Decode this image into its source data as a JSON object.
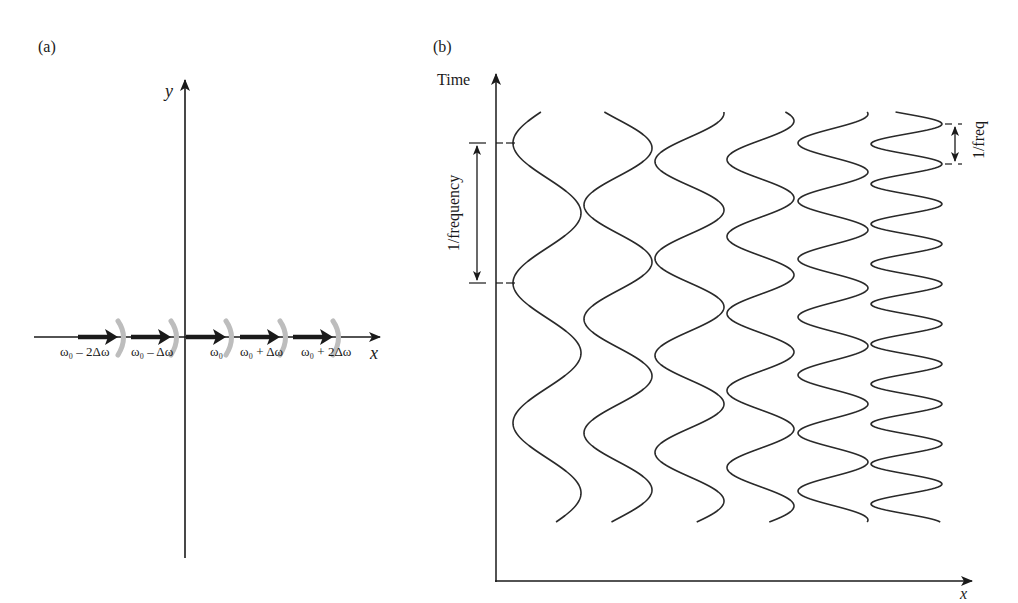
{
  "panel_a": {
    "label": "(a)",
    "y_axis_label": "y",
    "x_axis_label": "x",
    "frequency_labels": [
      "ω₀ – 2Δω",
      "ω₀ – Δω",
      "ω₀",
      "ω₀ + Δω",
      "ω₀ + 2Δω"
    ],
    "arrow_color": "#1a1a1a",
    "wavefront_color": "#bdbdbd"
  },
  "panel_b": {
    "label": "(b)",
    "y_axis_label": "Time",
    "x_axis_label": "x",
    "period_label_long": "1/frequency",
    "period_label_short": "1/freq",
    "waves": [
      {
        "x_left": 513,
        "x_right": 581,
        "period": 140,
        "first_right_peak": 73
      },
      {
        "x_left": 584,
        "x_right": 652,
        "period": 114,
        "first_right_peak": 148
      },
      {
        "x_left": 655,
        "x_right": 724,
        "period": 97,
        "first_right_peak": 113
      },
      {
        "x_left": 727,
        "x_right": 794,
        "period": 77,
        "first_right_peak": 121
      },
      {
        "x_left": 798,
        "x_right": 868,
        "period": 58,
        "first_right_peak": 114
      },
      {
        "x_left": 871,
        "x_right": 942,
        "period": 40,
        "first_right_peak": 124
      }
    ],
    "line_color": "#2a2a2a"
  }
}
